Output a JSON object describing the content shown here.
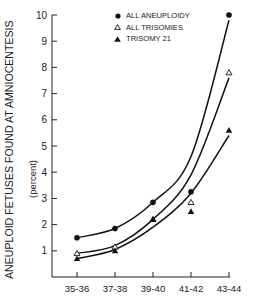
{
  "chart_data": {
    "type": "line",
    "title": "",
    "xlabel": "",
    "ylabel": "ANEUPLOID FETUSES FOUND AT AMNIOCENTESIS",
    "ylabel_sub": "(percent)",
    "categories": [
      "35-36",
      "37-38",
      "39-40",
      "41-42",
      "43-44"
    ],
    "yticks": [
      1,
      2,
      3,
      4,
      5,
      6,
      7,
      8,
      9,
      10
    ],
    "ylim": [
      0,
      10
    ],
    "grid": false,
    "legend_position": "top-center",
    "series": [
      {
        "name": "ALL ANEUPLOIDY",
        "marker": "filled-circle",
        "values": [
          1.5,
          1.85,
          2.85,
          3.25,
          10.0
        ]
      },
      {
        "name": "ALL TRISOMIES",
        "marker": "open-triangle",
        "values": [
          0.9,
          1.15,
          2.2,
          2.85,
          7.8
        ]
      },
      {
        "name": "TRISOMY 21",
        "marker": "filled-triangle",
        "values": [
          0.7,
          1.0,
          2.2,
          2.5,
          5.6
        ]
      }
    ],
    "fitted_curves": [
      {
        "series": "ALL ANEUPLOIDY",
        "points": [
          [
            0,
            1.5
          ],
          [
            1,
            1.85
          ],
          [
            2,
            2.85
          ],
          [
            3,
            4.6
          ],
          [
            4,
            9.8
          ]
        ]
      },
      {
        "series": "ALL TRISOMIES",
        "points": [
          [
            0,
            0.9
          ],
          [
            1,
            1.2
          ],
          [
            2,
            2.2
          ],
          [
            3,
            3.9
          ],
          [
            4,
            7.6
          ]
        ]
      },
      {
        "series": "TRISOMY 21",
        "points": [
          [
            0,
            0.7
          ],
          [
            1,
            1.05
          ],
          [
            2,
            1.9
          ],
          [
            3,
            3.2
          ],
          [
            4,
            5.4
          ]
        ]
      }
    ]
  },
  "legend": {
    "items": [
      {
        "label": "ALL ANEUPLOIDY",
        "marker": "filled-circle"
      },
      {
        "label": "ALL TRISOMIES",
        "marker": "open-triangle"
      },
      {
        "label": "TRISOMY 21",
        "marker": "filled-triangle"
      }
    ]
  },
  "axis": {
    "ylabel": "ANEUPLOID FETUSES FOUND AT AMNIOCENTESIS",
    "ylabel_sub": "(percent)"
  }
}
